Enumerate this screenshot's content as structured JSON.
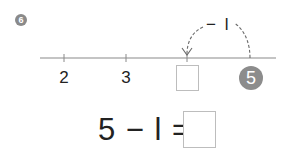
{
  "problem": {
    "number": "6"
  },
  "number_line": {
    "ticks": [
      {
        "label": "2",
        "x": 64
      },
      {
        "label": "3",
        "x": 126
      },
      {
        "label": "",
        "x": 187,
        "blank": true
      },
      {
        "label": "5",
        "x": 250,
        "highlighted": true
      }
    ],
    "hop": {
      "from": "5",
      "label": "− l",
      "direction": "left"
    }
  },
  "equation": {
    "text": "5 − l =",
    "answer": ""
  },
  "colors": {
    "line": "#8a8a8a",
    "circle": "#8c8c8c",
    "box_border": "#bdbdbd",
    "text": "#222222"
  }
}
